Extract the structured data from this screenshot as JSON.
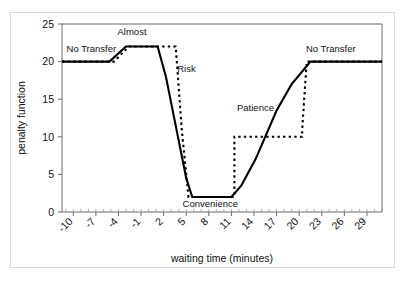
{
  "chart_data": {
    "type": "line",
    "title": "",
    "xlabel": "waiting time (minutes)",
    "ylabel": "penalty function",
    "xlim": [
      -11.5,
      31.0
    ],
    "ylim": [
      0,
      25
    ],
    "grid": false,
    "legend": "none",
    "xticks": [
      "-10",
      "-7",
      "-4",
      "-1",
      "2",
      "5",
      "8",
      "11",
      "14",
      "17",
      "20",
      "23",
      "26",
      "29"
    ],
    "xtick_values": [
      -10,
      -7,
      -4,
      -1,
      2,
      5,
      8,
      11,
      14,
      17,
      20,
      23,
      26,
      29
    ],
    "xtick_rotation": 45,
    "minor_xtick_step": 1,
    "yticks": [
      "0",
      "5",
      "10",
      "15",
      "20",
      "25"
    ],
    "ytick_values": [
      0,
      5,
      10,
      15,
      20,
      25
    ],
    "series": [
      {
        "name": "penalty function (smooth)",
        "style": "solid",
        "color": "#000000",
        "x": [
          -11.5,
          -5.2,
          -3.0,
          -1.0,
          1.2,
          2.3,
          5.0,
          5.8,
          11.0,
          12.3,
          14.2,
          17.0,
          19.0,
          21.5,
          31.0
        ],
        "y": [
          20.0,
          20.0,
          22.0,
          22.0,
          22.0,
          18.0,
          4.5,
          2.0,
          2.0,
          3.5,
          7.0,
          13.5,
          17.0,
          20.0,
          20.0
        ]
      },
      {
        "name": "penalty function (stepped)",
        "style": "dashed",
        "color": "#000000",
        "x": [
          -11.5,
          -4.6,
          -2.6,
          -0.2,
          3.6,
          3.9,
          4.4,
          5.3,
          11.0,
          11.4,
          11.4,
          20.4,
          20.4,
          21.0,
          31.0
        ],
        "y": [
          20.0,
          20.0,
          22.0,
          22.0,
          22.0,
          18.0,
          11.0,
          2.0,
          2.0,
          2.0,
          10.0,
          10.0,
          11.0,
          20.0,
          20.0
        ]
      }
    ],
    "annotations": [
      {
        "label": "No Transfer",
        "x": -7.6,
        "y": 21.3,
        "anchor": "middle",
        "name": "annotation-no-transfer-left"
      },
      {
        "label": "Almost",
        "x": -2.2,
        "y": 23.6,
        "anchor": "middle",
        "name": "annotation-almost"
      },
      {
        "label": "Risk",
        "x": 3.8,
        "y": 18.6,
        "anchor": "start",
        "name": "annotation-risk"
      },
      {
        "label": "Convenience",
        "x": 8.2,
        "y": 0.7,
        "anchor": "middle",
        "name": "annotation-convenience"
      },
      {
        "label": "Patience",
        "x": 14.2,
        "y": 13.4,
        "anchor": "middle",
        "name": "annotation-patience"
      },
      {
        "label": "No Transfer",
        "x": 24.2,
        "y": 21.3,
        "anchor": "middle",
        "name": "annotation-no-transfer-right"
      }
    ]
  }
}
